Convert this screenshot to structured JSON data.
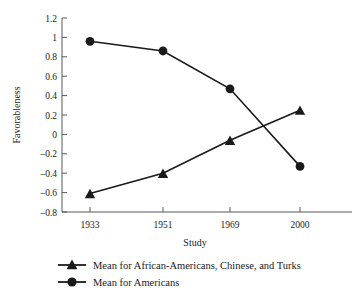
{
  "chart_data": {
    "type": "line",
    "title": "",
    "xlabel": "Study",
    "ylabel": "Favorableness",
    "categories": [
      "1933",
      "1951",
      "1969",
      "2000"
    ],
    "ylim": [
      -0.8,
      1.2
    ],
    "ytick_labels": [
      "1.2",
      "1",
      "0.8",
      "0.6",
      "0.4",
      "0.2",
      "0",
      "–0.2",
      "–0.4",
      "–0.6",
      "–0.8"
    ],
    "ytick_values": [
      1.2,
      1.0,
      0.8,
      0.6,
      0.4,
      0.2,
      0.0,
      -0.2,
      -0.4,
      -0.6,
      -0.8
    ],
    "grid": false,
    "legend_position": "below",
    "series": [
      {
        "name": "Mean for African-Americans, Chinese, and Turks",
        "marker": "triangle",
        "color": "#1a1a1a",
        "values": [
          -0.61,
          -0.4,
          -0.06,
          0.25
        ]
      },
      {
        "name": "Mean for Americans",
        "marker": "circle",
        "color": "#1a1a1a",
        "values": [
          0.96,
          0.86,
          0.47,
          -0.33
        ]
      }
    ]
  },
  "axes": {
    "y_title": "Favorableness",
    "x_title": "Study"
  },
  "legend": {
    "items": [
      {
        "label": "Mean for African-Americans, Chinese, and Turks",
        "marker": "triangle-marker"
      },
      {
        "label": "Mean for Americans",
        "marker": "circle-marker"
      }
    ]
  }
}
